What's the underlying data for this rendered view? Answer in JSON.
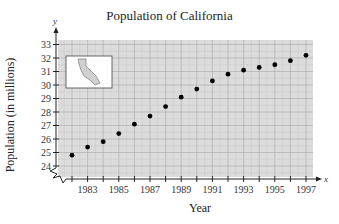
{
  "chart_data": {
    "type": "scatter",
    "title": "Population of California",
    "xlabel": "Year",
    "ylabel": "Population (in millions)",
    "x_axis_var": "x",
    "y_axis_var": "y",
    "x": [
      1982,
      1983,
      1984,
      1985,
      1986,
      1987,
      1988,
      1989,
      1990,
      1991,
      1992,
      1993,
      1994,
      1995,
      1996,
      1997
    ],
    "y": [
      24.8,
      25.4,
      25.8,
      26.4,
      27.1,
      27.7,
      28.4,
      29.1,
      29.7,
      30.3,
      30.8,
      31.1,
      31.3,
      31.5,
      31.8,
      32.2
    ],
    "x_tick_labels": [
      "1983",
      "1985",
      "1987",
      "1989",
      "1991",
      "1993",
      "1995",
      "1997"
    ],
    "y_tick_labels": [
      "24",
      "25",
      "26",
      "27",
      "28",
      "29",
      "30",
      "31",
      "32",
      "33"
    ],
    "xlim": [
      1981,
      1997.5
    ],
    "ylim": [
      23.2,
      33.3
    ],
    "grid": true,
    "axis_break": "y-axis break below 24",
    "inset": "outline map of California",
    "colors": {
      "grid_bg": "#dcdcdc",
      "grid_line": "#a8a8a8",
      "point": "#000000"
    }
  }
}
